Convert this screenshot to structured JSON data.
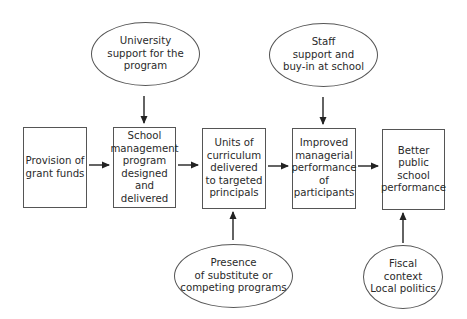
{
  "diagram": {
    "boxes": [
      {
        "id": "b1",
        "label": "Provision of\ngrant funds"
      },
      {
        "id": "b2",
        "label": "School\nmanagement\nprogram\ndesigned and\ndelivered"
      },
      {
        "id": "b3",
        "label": "Units of\ncurriculum\ndelivered\nto targeted\nprincipals"
      },
      {
        "id": "b4",
        "label": "Improved\nmanagerial\nperformance\nof\nparticipants"
      },
      {
        "id": "b5",
        "label": "Better public\nschool\nperformance"
      }
    ],
    "ellipses": [
      {
        "id": "e1",
        "label": "University\nsupport for the\nprogram",
        "target": "b2",
        "position": "above"
      },
      {
        "id": "e2",
        "label": "Staff\nsupport and\nbuy-in at school",
        "target": "b4",
        "position": "above"
      },
      {
        "id": "e3",
        "label": "Presence\nof substitute or\ncompeting programs",
        "target": "b3",
        "position": "below"
      },
      {
        "id": "e4",
        "label": "Fiscal\ncontext\nLocal politics",
        "target": "b5",
        "position": "below"
      }
    ],
    "edges": [
      {
        "from": "b1",
        "to": "b2"
      },
      {
        "from": "b2",
        "to": "b3"
      },
      {
        "from": "b3",
        "to": "b4"
      },
      {
        "from": "b4",
        "to": "b5"
      },
      {
        "from": "e1",
        "to": "b2"
      },
      {
        "from": "e2",
        "to": "b4"
      },
      {
        "from": "e3",
        "to": "b3"
      },
      {
        "from": "e4",
        "to": "b5"
      }
    ],
    "colors": {
      "stroke": "#555555",
      "text": "#2a2a2a",
      "background": "#ffffff"
    }
  }
}
